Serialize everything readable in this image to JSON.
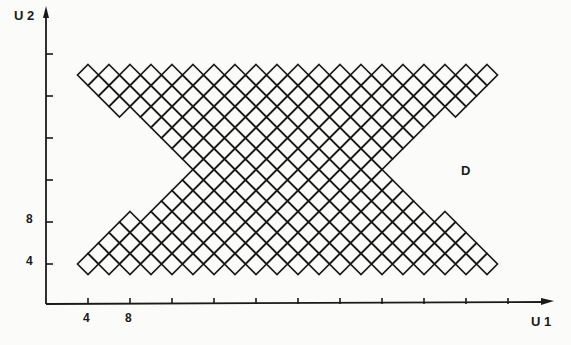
{
  "figure": {
    "y_axis_label": "U 2",
    "x_axis_label": "U 1",
    "region_label": "D",
    "x_tick_labels": [
      "4",
      "8"
    ],
    "y_tick_labels": [
      "4",
      "8"
    ],
    "ink_color": "#1a1a1a",
    "background_color": "#fbfbf9"
  },
  "axes": {
    "unit_px": 10.5,
    "origin_px": [
      46,
      304
    ],
    "x_ticks": [
      4,
      8,
      12,
      16,
      20,
      24,
      28,
      32,
      36,
      40,
      44
    ],
    "y_ticks": [
      4,
      8,
      12,
      16,
      20,
      24
    ]
  },
  "lattice": {
    "description": "Diamond lattice of cells centered at integer points (U1,U2) with U1+U2 even; hourglass-shaped region D",
    "half_diagonal_units": 2,
    "rows": [
      {
        "u2": 22,
        "u1_start": 4,
        "u1_end": 42
      },
      {
        "u2": 21,
        "u1_start": 5,
        "u1_end": 41
      },
      {
        "u2": 20,
        "u1_start": 6,
        "u1_end": 40
      },
      {
        "u2": 19,
        "u1_start": 7,
        "u1_end": 39
      },
      {
        "u2": 18,
        "u1_start": 10,
        "u1_end": 36
      },
      {
        "u2": 17,
        "u1_start": 11,
        "u1_end": 35
      },
      {
        "u2": 16,
        "u1_start": 12,
        "u1_end": 34
      },
      {
        "u2": 15,
        "u1_start": 13,
        "u1_end": 33
      },
      {
        "u2": 14,
        "u1_start": 14,
        "u1_end": 32
      },
      {
        "u2": 13,
        "u1_start": 15,
        "u1_end": 31
      },
      {
        "u2": 12,
        "u1_start": 14,
        "u1_end": 32
      },
      {
        "u2": 11,
        "u1_start": 13,
        "u1_end": 33
      },
      {
        "u2": 10,
        "u1_start": 12,
        "u1_end": 34
      },
      {
        "u2": 9,
        "u1_start": 11,
        "u1_end": 35
      },
      {
        "u2": 8,
        "u1_start": 8,
        "u1_end": 38
      },
      {
        "u2": 7,
        "u1_start": 7,
        "u1_end": 39
      },
      {
        "u2": 6,
        "u1_start": 6,
        "u1_end": 40
      },
      {
        "u2": 5,
        "u1_start": 5,
        "u1_end": 41
      },
      {
        "u2": 4,
        "u1_start": 4,
        "u1_end": 42
      }
    ]
  }
}
